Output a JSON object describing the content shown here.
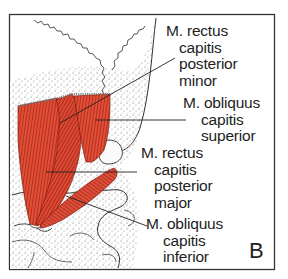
{
  "figure": {
    "panel_letter": "B",
    "colors": {
      "muscle": "#d8402c",
      "muscle_dark": "#a82418",
      "bone_stipple": "#555555",
      "frame": "#333333",
      "text": "#1e1e1e"
    },
    "labels": [
      {
        "id": "rectus-capitis-posterior-minor",
        "lines": [
          "M. rectus",
          "capitis",
          "posterior",
          "minor"
        ]
      },
      {
        "id": "obliquus-capitis-superior",
        "lines": [
          "M. obliquus",
          "capitis",
          "superior"
        ]
      },
      {
        "id": "rectus-capitis-posterior-major",
        "lines": [
          "M. rectus",
          "capitis",
          "posterior",
          "major"
        ]
      },
      {
        "id": "obliquus-capitis-inferior",
        "lines": [
          "M. obliquus",
          "capitis",
          "inferior"
        ]
      }
    ]
  }
}
